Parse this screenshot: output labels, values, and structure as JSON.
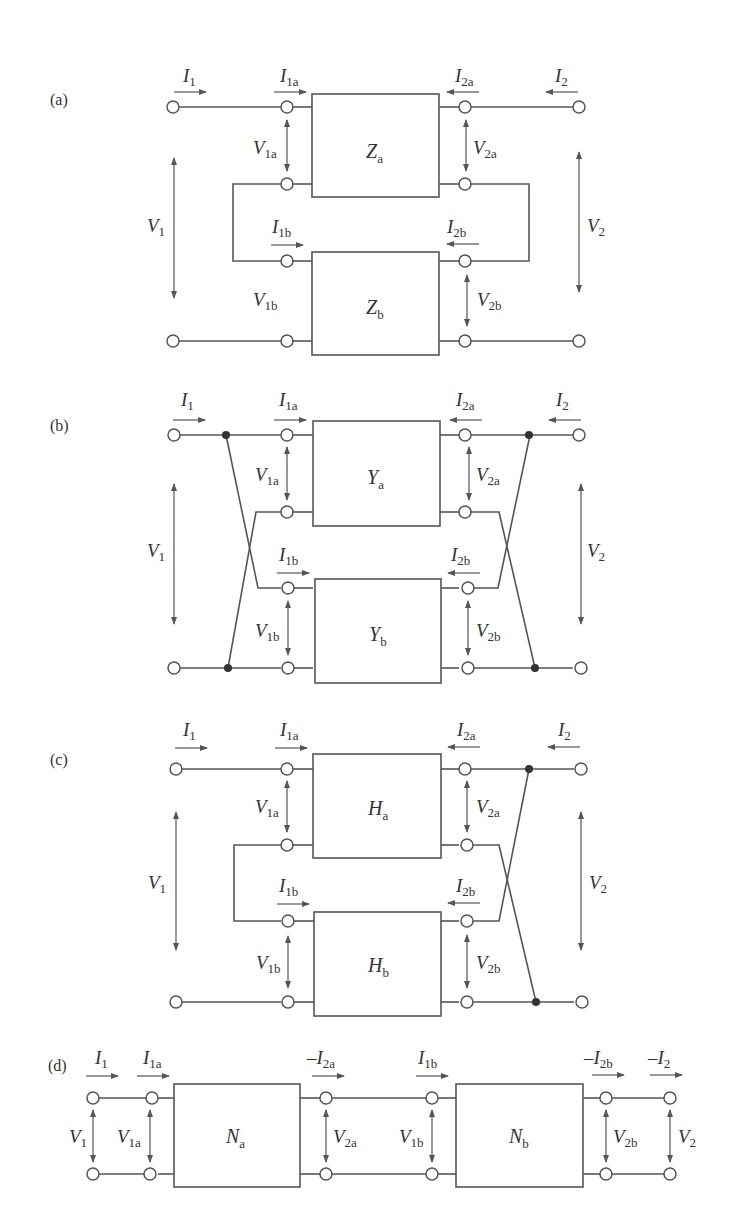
{
  "panels": {
    "a": {
      "tag": "(a)",
      "box_top": {
        "main": "Z",
        "sub": "a"
      },
      "box_bottom": {
        "main": "Z",
        "sub": "b"
      },
      "connection": "series-series"
    },
    "b": {
      "tag": "(b)",
      "box_top": {
        "main": "Y",
        "sub": "a"
      },
      "box_bottom": {
        "main": "Y",
        "sub": "b"
      },
      "connection": "parallel-parallel"
    },
    "c": {
      "tag": "(c)",
      "box_top": {
        "main": "H",
        "sub": "a"
      },
      "box_bottom": {
        "main": "H",
        "sub": "b"
      },
      "connection": "series-parallel"
    },
    "d": {
      "tag": "(d)",
      "box_left": {
        "main": "N",
        "sub": "a"
      },
      "box_right": {
        "main": "N",
        "sub": "b"
      },
      "connection": "cascade"
    }
  },
  "labels": {
    "I1": {
      "main": "I",
      "sub": "1"
    },
    "I2": {
      "main": "I",
      "sub": "2"
    },
    "I1a": {
      "main": "I",
      "sub": "1a"
    },
    "I2a": {
      "main": "I",
      "sub": "2a"
    },
    "I1b": {
      "main": "I",
      "sub": "1b"
    },
    "I2b": {
      "main": "I",
      "sub": "2b"
    },
    "V1": {
      "main": "V",
      "sub": "1"
    },
    "V2": {
      "main": "V",
      "sub": "2"
    },
    "V1a": {
      "main": "V",
      "sub": "1a"
    },
    "V2a": {
      "main": "V",
      "sub": "2a"
    },
    "V1b": {
      "main": "V",
      "sub": "1b"
    },
    "V2b": {
      "main": "V",
      "sub": "2b"
    },
    "negI2a": {
      "main": "–I",
      "sub": "2a"
    },
    "negI2b": {
      "main": "–I",
      "sub": "2b"
    },
    "negI2": {
      "main": "–I",
      "sub": "2"
    }
  }
}
